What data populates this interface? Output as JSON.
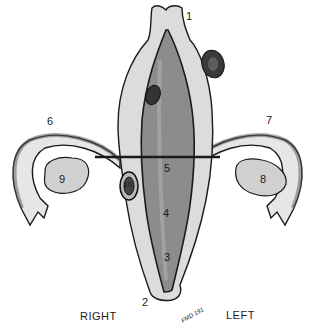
{
  "figure": {
    "type": "anatomical illustration",
    "labels": [
      {
        "id": "1",
        "x": 186,
        "y": 15
      },
      {
        "id": "2",
        "x": 142,
        "y": 299
      },
      {
        "id": "3",
        "x": 163,
        "y": 253
      },
      {
        "id": "4",
        "x": 163,
        "y": 209
      },
      {
        "id": "5",
        "x": 164,
        "y": 163
      },
      {
        "id": "6",
        "x": 47,
        "y": 118
      },
      {
        "id": "7",
        "x": 266,
        "y": 117
      },
      {
        "id": "8",
        "x": 260,
        "y": 175
      },
      {
        "id": "9",
        "x": 58,
        "y": 175
      },
      {
        "id": "10",
        "x": 123,
        "y": 182
      }
    ],
    "side_labels": {
      "right": "RIGHT",
      "left": "LEFT"
    },
    "signature": "FMD 191",
    "colors": {
      "line": "#1a1a1a",
      "tissue": "#d9d9d9",
      "cavity": "#8a8a8a",
      "dark": "#333333"
    }
  }
}
